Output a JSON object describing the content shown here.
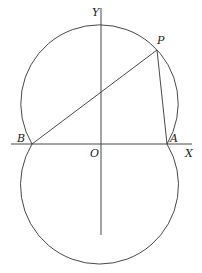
{
  "diagram": {
    "labels": {
      "y_axis": "Y",
      "x_axis": "X",
      "origin": "O",
      "point_p": "P",
      "point_a": "A",
      "point_b": "B"
    },
    "colors": {
      "stroke": "#333333",
      "background": "#ffffff"
    }
  }
}
